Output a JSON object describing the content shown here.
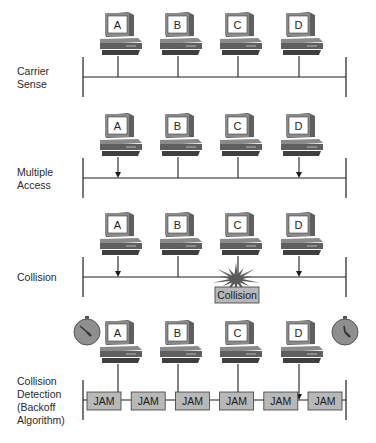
{
  "colors": {
    "line": "#1e1e1e",
    "pc_body": "#5f5f5f",
    "pc_dark": "#3f3f3f",
    "pc_light": "#8a8a8a",
    "screen": "#ffffff",
    "box_fill": "#b8b8b8",
    "box_stroke": "#3a3a3a",
    "burst": "#5a5a5a",
    "timer_fill": "#8f8f8f"
  },
  "stations": [
    "A",
    "B",
    "C",
    "D"
  ],
  "panels": [
    {
      "id": "carrier-sense",
      "label_lines": [
        "Carrier",
        "Sense"
      ],
      "arrows": [],
      "collision_label": null,
      "jam": false,
      "timers": false
    },
    {
      "id": "multiple-access",
      "label_lines": [
        "Multiple",
        "Access"
      ],
      "arrows": [
        "A",
        "D"
      ],
      "collision_label": null,
      "jam": false,
      "timers": false
    },
    {
      "id": "collision",
      "label_lines": [
        "Collision"
      ],
      "arrows": [
        "A",
        "D"
      ],
      "collision_label": "Collision",
      "jam": false,
      "timers": false
    },
    {
      "id": "collision-detection",
      "label_lines": [
        "Collision",
        "Detection",
        "(Backoff",
        "Algorithm)"
      ],
      "arrows": [
        "A",
        "D"
      ],
      "collision_label": null,
      "jam": true,
      "jam_labels": [
        "JAM",
        "JAM",
        "JAM",
        "JAM",
        "JAM",
        "JAM"
      ],
      "timers": true
    }
  ]
}
